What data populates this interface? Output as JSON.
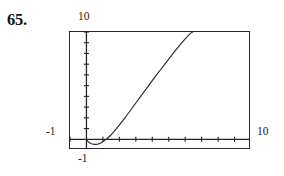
{
  "figure": {
    "problem_number": "65.",
    "labels": {
      "y_max": "10",
      "y_min": "-1",
      "x_min": "-1",
      "x_max": "10"
    },
    "colors": {
      "ink": "#1a1a1a",
      "frame": "#2a2a2a",
      "curve": "#2b2b2b",
      "background": "#ffffff"
    }
  },
  "chart_data": {
    "type": "line",
    "title": "",
    "subtitle": "",
    "xlabel": "",
    "ylabel": "",
    "grid": false,
    "legend": null,
    "legend_position": "none",
    "xlim": [
      -1,
      10
    ],
    "ylim": [
      -1,
      10
    ],
    "x_tick_labels": [
      "-1",
      "10"
    ],
    "y_tick_labels": [
      "-1",
      "10"
    ],
    "x_tick_interval": 1,
    "y_tick_interval": 1,
    "axis_origin": [
      0,
      0
    ],
    "series": [
      {
        "name": "curve",
        "points": [
          [
            0.0,
            -0.05
          ],
          [
            0.15,
            -0.3
          ],
          [
            0.3,
            -0.42
          ],
          [
            0.5,
            -0.48
          ],
          [
            0.7,
            -0.45
          ],
          [
            0.9,
            -0.33
          ],
          [
            1.1,
            -0.12
          ],
          [
            1.25,
            0.05
          ],
          [
            1.5,
            0.42
          ],
          [
            1.8,
            0.95
          ],
          [
            2.1,
            1.52
          ],
          [
            2.4,
            2.12
          ],
          [
            2.7,
            2.75
          ],
          [
            3.0,
            3.38
          ],
          [
            3.3,
            4.0
          ],
          [
            3.6,
            4.62
          ],
          [
            3.9,
            5.25
          ],
          [
            4.2,
            5.88
          ],
          [
            4.5,
            6.48
          ],
          [
            4.8,
            7.08
          ],
          [
            5.1,
            7.68
          ],
          [
            5.4,
            8.26
          ],
          [
            5.7,
            8.82
          ],
          [
            6.0,
            9.35
          ],
          [
            6.3,
            9.85
          ],
          [
            6.45,
            10.0
          ]
        ]
      }
    ]
  }
}
